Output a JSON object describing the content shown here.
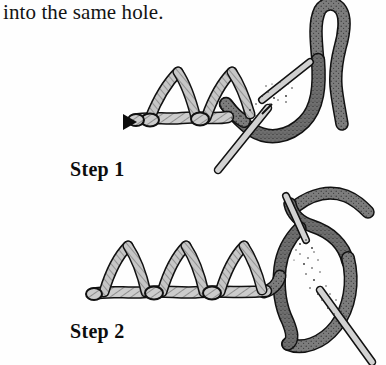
{
  "document": {
    "type": "instructional-illustration",
    "subject": "embroidery chain stitch tutorial",
    "background_color": "#ffffff"
  },
  "caption": {
    "text": "into the same hole."
  },
  "steps": [
    {
      "id": "step-1",
      "label": "Step 1",
      "marker": "start-arrow",
      "loop_count": 2,
      "description": "needle and working thread pulled through, two completed loops on base line"
    },
    {
      "id": "step-2",
      "label": "Step 2",
      "marker": "none",
      "loop_count": 3,
      "description": "needle passing through thread loop, three completed loops on base line"
    }
  ],
  "colors": {
    "ink": "#141414",
    "outline": "#111111",
    "thread_light": "#c9c9c9",
    "thread_light_shade": "#b0b0b0",
    "thread_dark": "#7d7d7d",
    "thread_dark_shade": "#5f5f5f",
    "needle": "#d2d2d2",
    "paper": "#ffffff"
  },
  "icons": {
    "start_arrow": "left-triangle-marker"
  }
}
